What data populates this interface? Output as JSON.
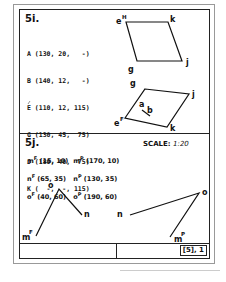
{
  "section_i": {
    "title": "5i.",
    "coordinates": [
      "A (130, 20,   -)",
      "B (140, 12,   -)",
      "E (110, 12, 115)",
      "G (130, 45,  75)",
      "J (180, 40,  75)",
      "K (  -,  -, 115)"
    ],
    "upper_figure": {
      "labels": {
        "e": "e",
        "e_sup": "H",
        "k": "k",
        "g": "g",
        "j": "j"
      }
    },
    "lower_figure": {
      "labels": {
        "g": "g",
        "j": "j",
        "a": "a",
        "b": "b",
        "e": "e",
        "e_sup": "F",
        "k": "k"
      }
    }
  },
  "section_j": {
    "title": "5j.",
    "scale_label": "SCALE:",
    "scale_value": "1:20",
    "coordinates": [
      {
        "left_label": "m",
        "left_sup": "F",
        "left_value": "(15, 10)",
        "right_label": "m",
        "right_sup": "P",
        "right_value": "(170, 10)"
      },
      {
        "left_label": "n",
        "left_sup": "F",
        "left_value": "(65, 35)",
        "right_label": "n",
        "right_sup": "P",
        "right_value": "(130, 35)"
      },
      {
        "left_label": "o",
        "left_sup": "F",
        "left_value": "(40, 60)",
        "right_label": "o",
        "right_sup": "P",
        "right_value": "(190, 60)"
      }
    ],
    "front_view": {
      "o": "o",
      "n": "n",
      "m": "m",
      "m_sup": "F"
    },
    "plan_view": {
      "o": "o",
      "n": "n",
      "m": "m",
      "m_sup": "P"
    }
  },
  "footer": {
    "reference": "[5], 1"
  }
}
